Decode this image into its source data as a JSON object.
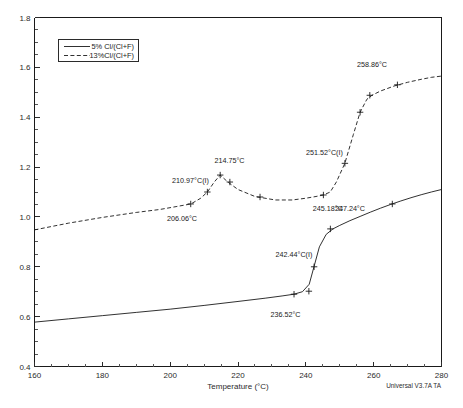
{
  "chart_data": {
    "type": "line",
    "title": "",
    "xlabel": "Temperature (°C)",
    "ylabel": "",
    "xlim": [
      160,
      280
    ],
    "ylim": [
      0.4,
      1.8
    ],
    "xticks": [
      "160",
      "180",
      "200",
      "220",
      "240",
      "260",
      "280"
    ],
    "yticks": [
      "0.4",
      "0.6",
      "0.8",
      "1.0",
      "1.2",
      "1.4",
      "1.6",
      "1.8"
    ],
    "xtick_values": [
      160,
      180,
      200,
      220,
      240,
      260,
      280
    ],
    "ytick_values": [
      0.4,
      0.6,
      0.8,
      1.0,
      1.2,
      1.4,
      1.6,
      1.8
    ],
    "grid": false,
    "legend_position": "upper-left",
    "series": [
      {
        "name": "5% Cl/(Cl+F)",
        "style": "solid",
        "x": [
          160,
          170,
          180,
          190,
          200,
          210,
          220,
          228,
          233,
          236.5,
          239,
          241,
          242.4,
          244,
          246,
          248,
          250,
          253,
          256,
          259,
          262,
          265,
          268,
          271,
          274,
          277,
          280
        ],
        "y": [
          0.578,
          0.591,
          0.604,
          0.617,
          0.63,
          0.645,
          0.661,
          0.674,
          0.683,
          0.69,
          0.7,
          0.73,
          0.8,
          0.88,
          0.93,
          0.952,
          0.966,
          0.985,
          1.002,
          1.019,
          1.035,
          1.05,
          1.064,
          1.077,
          1.089,
          1.1,
          1.11
        ]
      },
      {
        "name": "13%Cl/(Cl+F)",
        "style": "dashed",
        "x": [
          160,
          170,
          180,
          190,
          197,
          202,
          206.1,
          209,
          210.97,
          213,
          214.75,
          217,
          220,
          225,
          231,
          236,
          240,
          243,
          245.18,
          247.2,
          249,
          251.5,
          254,
          256,
          258,
          259.5,
          262,
          266,
          270,
          274,
          277,
          280
        ],
        "y": [
          0.948,
          0.975,
          0.998,
          1.018,
          1.03,
          1.042,
          1.052,
          1.075,
          1.1,
          1.14,
          1.168,
          1.14,
          1.11,
          1.082,
          1.068,
          1.068,
          1.075,
          1.082,
          1.088,
          1.1,
          1.14,
          1.215,
          1.33,
          1.42,
          1.472,
          1.488,
          1.505,
          1.525,
          1.54,
          1.552,
          1.56,
          1.565
        ]
      }
    ],
    "annotations": [
      {
        "label": "206.06°C",
        "x": 206.06,
        "y": 1.052,
        "text_x": 203.5,
        "text_y": 0.985,
        "anchor": "middle"
      },
      {
        "label": "210.97°C(I)",
        "x": 210.97,
        "y": 1.1,
        "text_x": 206.0,
        "text_y": 1.135,
        "anchor": "middle"
      },
      {
        "label": "214.75°C",
        "x": 214.75,
        "y": 1.168,
        "text_x": 217.5,
        "text_y": 1.215,
        "anchor": "middle"
      },
      {
        "label": "245.18°C",
        "x": 245.18,
        "y": 1.088,
        "text_x": 246.5,
        "text_y": 1.022,
        "anchor": "middle"
      },
      {
        "label": "251.52°C(I)",
        "x": 251.52,
        "y": 1.215,
        "text_x": 245.5,
        "text_y": 1.25,
        "anchor": "middle"
      },
      {
        "label": "258.86°C",
        "x": 258.86,
        "y": 1.488,
        "text_x": 259.5,
        "text_y": 1.6,
        "anchor": "middle"
      },
      {
        "label": "236.52°C",
        "x": 236.52,
        "y": 0.69,
        "text_x": 234.0,
        "text_y": 0.598,
        "anchor": "middle"
      },
      {
        "label": "242.44°C(I)",
        "x": 242.44,
        "y": 0.8,
        "text_x": 236.5,
        "text_y": 0.838,
        "anchor": "middle"
      },
      {
        "label": "247.24°C",
        "x": 247.24,
        "y": 0.952,
        "text_x": 253.0,
        "text_y": 1.022,
        "anchor": "middle"
      }
    ],
    "markers": [
      {
        "x": 206.06,
        "y": 1.052
      },
      {
        "x": 210.97,
        "y": 1.1
      },
      {
        "x": 214.75,
        "y": 1.168
      },
      {
        "x": 217.6,
        "y": 1.14
      },
      {
        "x": 226.5,
        "y": 1.08
      },
      {
        "x": 245.18,
        "y": 1.088
      },
      {
        "x": 251.52,
        "y": 1.215
      },
      {
        "x": 256.0,
        "y": 1.42
      },
      {
        "x": 258.86,
        "y": 1.488
      },
      {
        "x": 267.0,
        "y": 1.53
      },
      {
        "x": 236.52,
        "y": 0.69
      },
      {
        "x": 242.44,
        "y": 0.8
      },
      {
        "x": 240.9,
        "y": 0.702
      },
      {
        "x": 247.24,
        "y": 0.952
      },
      {
        "x": 265.5,
        "y": 1.052
      }
    ]
  },
  "legend": {
    "entries": [
      {
        "label": "5% Cl/(Cl+F)",
        "style": "solid"
      },
      {
        "label": "13%Cl/(Cl+F)",
        "style": "dashed"
      }
    ]
  },
  "footer": {
    "software_note": "Universal V3.7A TA"
  },
  "caption": {
    "text": ""
  }
}
